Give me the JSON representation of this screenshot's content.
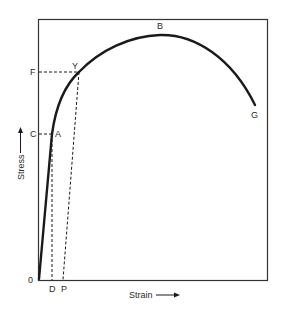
{
  "diagram": {
    "type": "stress-strain-curve",
    "axes": {
      "x_label": "Strain",
      "y_label": "Stress",
      "origin_label": "0"
    },
    "points": {
      "A": "A",
      "Y": "Y",
      "B": "B",
      "G": "G"
    },
    "axis_markers": {
      "C": "C",
      "F": "F",
      "D": "D",
      "P": "P"
    },
    "colors": {
      "stroke": "#1a1a1a",
      "frame": "#333333",
      "text": "#2a2a2a",
      "background": "#ffffff"
    }
  }
}
